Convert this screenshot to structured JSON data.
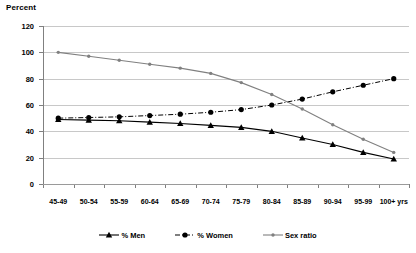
{
  "chart_data": {
    "type": "line",
    "title": "Percent",
    "xlabel": "",
    "ylabel": "Percent",
    "ylim": [
      0,
      120
    ],
    "yticks": [
      0,
      20,
      40,
      60,
      80,
      100,
      120
    ],
    "grid": true,
    "legend_position": "bottom",
    "categories": [
      "45-49",
      "50-54",
      "55-59",
      "60-64",
      "65-69",
      "70-74",
      "75-79",
      "80-84",
      "85-89",
      "90-94",
      "95-99",
      "100+ yrs"
    ],
    "series": [
      {
        "name": "% Men",
        "marker": "triangle",
        "line_style": "solid",
        "color": "#000000",
        "values": [
          49,
          48.5,
          48,
          47,
          46,
          44.5,
          43,
          40,
          35,
          30,
          24,
          19
        ]
      },
      {
        "name": "% Women",
        "marker": "circle",
        "line_style": "dash-dot",
        "color": "#000000",
        "values": [
          50,
          50.5,
          51,
          52,
          53,
          54.5,
          56.5,
          60,
          64.5,
          70,
          75,
          80
        ]
      },
      {
        "name": "Sex ratio",
        "marker": "dot",
        "line_style": "solid",
        "color": "#808080",
        "values": [
          100,
          97,
          94,
          91,
          88,
          84,
          77,
          68,
          57,
          45,
          34,
          24
        ]
      }
    ]
  },
  "legend": {
    "items": [
      {
        "label": "% Men"
      },
      {
        "label": "% Women"
      },
      {
        "label": "Sex ratio"
      }
    ]
  },
  "colors": {
    "grid": "#c8c8c8",
    "axis": "#808080",
    "series_men": "#000000",
    "series_women": "#000000",
    "series_sexratio": "#808080"
  }
}
